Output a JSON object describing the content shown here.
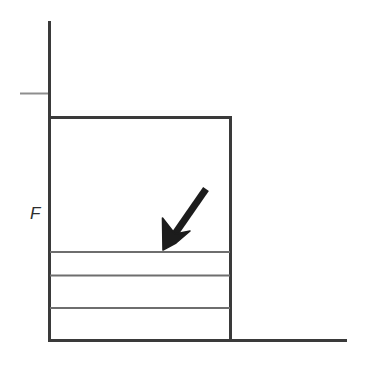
{
  "figure": {
    "background_color": "#ffffff",
    "line_color": "#3a3a3a",
    "light_line_color": "#9a9a9a",
    "arrow_color": "#1c1c1c",
    "labels": {
      "force": "F"
    },
    "geometry": {
      "vertical_reference_line": {
        "x": 49,
        "y_top": 21,
        "y_bottom": 117
      },
      "reference_tick": {
        "x_start": 20,
        "x_end": 48,
        "y": 93
      },
      "block": {
        "x_left": 49,
        "x_right": 231,
        "y_top": 117,
        "y_bottom": 341
      },
      "ground_line": {
        "x_start": 49,
        "x_end": 347,
        "y": 341
      },
      "layer_dividers_y": [
        252,
        275,
        308
      ],
      "arrow": {
        "tail_x": 207,
        "tail_y": 188,
        "tip_x": 163,
        "tip_y": 250
      }
    },
    "layers": [
      {
        "name": "layer-top",
        "y_top": 117,
        "y_bottom": 252
      },
      {
        "name": "layer-2",
        "y_top": 252,
        "y_bottom": 275
      },
      {
        "name": "layer-3",
        "y_top": 275,
        "y_bottom": 308
      },
      {
        "name": "layer-4",
        "y_top": 308,
        "y_bottom": 341
      }
    ]
  }
}
